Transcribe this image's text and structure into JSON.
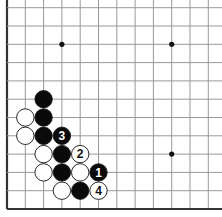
{
  "diagram": {
    "board": {
      "columns": 12,
      "rows": 12,
      "spacing": 18.3,
      "left_edge_x": 7,
      "bottom_edge_y": 209,
      "edges": [
        "left",
        "bottom"
      ],
      "line_color": "#999999",
      "edge_color": "#333333",
      "star_points": [
        {
          "col": 3,
          "row": 9
        },
        {
          "col": 9,
          "row": 9
        },
        {
          "col": 9,
          "row": 3
        }
      ]
    },
    "stones": [
      {
        "color": "black",
        "col": 2,
        "row": 6,
        "label": ""
      },
      {
        "color": "black",
        "col": 2,
        "row": 5,
        "label": ""
      },
      {
        "color": "white",
        "col": 1,
        "row": 5,
        "label": ""
      },
      {
        "color": "black",
        "col": 2,
        "row": 4,
        "label": ""
      },
      {
        "color": "white",
        "col": 1,
        "row": 4,
        "label": ""
      },
      {
        "color": "black",
        "col": 3,
        "row": 4,
        "label": "3"
      },
      {
        "color": "white",
        "col": 2,
        "row": 3,
        "label": ""
      },
      {
        "color": "black",
        "col": 3,
        "row": 3,
        "label": ""
      },
      {
        "color": "white",
        "col": 4,
        "row": 3,
        "label": "2"
      },
      {
        "color": "white",
        "col": 2,
        "row": 2,
        "label": ""
      },
      {
        "color": "black",
        "col": 3,
        "row": 2,
        "label": ""
      },
      {
        "color": "white",
        "col": 4,
        "row": 2,
        "label": ""
      },
      {
        "color": "black",
        "col": 5,
        "row": 2,
        "label": "1"
      },
      {
        "color": "white",
        "col": 3,
        "row": 1,
        "label": ""
      },
      {
        "color": "black",
        "col": 4,
        "row": 1,
        "label": ""
      },
      {
        "color": "white",
        "col": 5,
        "row": 1,
        "label": "4"
      }
    ],
    "move_labels": [
      "1",
      "2",
      "3",
      "4"
    ]
  }
}
